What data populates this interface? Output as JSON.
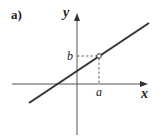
{
  "figure": {
    "panel_label": "a)",
    "x_axis_label": "x",
    "y_axis_label": "y",
    "point_x_label": "a",
    "point_y_label": "b",
    "colors": {
      "line": "#333333",
      "axes": "#555555",
      "dashed": "#555555",
      "text": "#222222",
      "background": "#ffffff"
    }
  },
  "diagram": {
    "type": "linear-function-graph",
    "line": {
      "from": [
        29,
        103
      ],
      "to": [
        149,
        23
      ]
    },
    "marked_point": {
      "label_x": "a",
      "label_y": "b",
      "pixel": [
        99,
        56
      ]
    },
    "axes": {
      "origin_pixel": [
        77,
        84
      ]
    }
  }
}
